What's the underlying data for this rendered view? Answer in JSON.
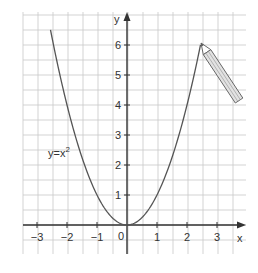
{
  "chart_data": {
    "type": "line",
    "title": "",
    "xlabel": "x",
    "ylabel": "y",
    "xlim": [
      -3.5,
      3.5
    ],
    "ylim": [
      -1,
      6.5
    ],
    "grid": true,
    "grid_step": 0.5,
    "x_ticks": [
      -3,
      -2,
      -1,
      1,
      2,
      3
    ],
    "x_tick_labels": [
      "−3",
      "−2",
      "−1",
      "1",
      "2",
      "3"
    ],
    "y_ticks": [
      1,
      2,
      3,
      4,
      5,
      6
    ],
    "y_tick_labels": [
      "1",
      "2",
      "3",
      "4",
      "5",
      "6"
    ],
    "origin_label": "0",
    "series": [
      {
        "name": "y=x²",
        "function": "x^2",
        "x_range": [
          -2.55,
          2.45
        ],
        "x": [
          -2.5,
          -2,
          -1.5,
          -1,
          -0.5,
          0,
          0.5,
          1,
          1.5,
          2,
          2.45
        ],
        "y": [
          6.25,
          4,
          2.25,
          1,
          0.25,
          0,
          0.25,
          1,
          2.25,
          4,
          6.0
        ]
      }
    ],
    "annotations": [
      {
        "text": "y=x",
        "superscript": "2",
        "near": [
          -2,
          3
        ]
      },
      {
        "type": "pencil",
        "tip": [
          2.45,
          6.0
        ],
        "description": "pencil drawing the curve"
      }
    ],
    "colors": {
      "grid": "#c8c8c8",
      "axis": "#333333",
      "curve": "#555555",
      "pencil_fill": "#e2e2e2",
      "pencil_stroke": "#666666"
    }
  },
  "labels": {
    "x_axis": "x",
    "y_axis": "y",
    "origin": "0",
    "equation_base": "y=x",
    "equation_exp": "2",
    "x_ticks": [
      "−3",
      "−2",
      "−1",
      "1",
      "2",
      "3"
    ],
    "y_ticks": [
      "1",
      "2",
      "3",
      "4",
      "5",
      "6"
    ]
  }
}
